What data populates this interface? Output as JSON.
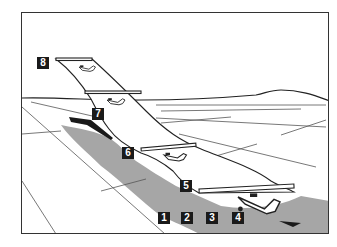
{
  "diagram": {
    "type": "takeoff-sequence-illustration",
    "colors": {
      "frame": "#333333",
      "shadow": "#a6a6a6",
      "line": "#222222",
      "runway_lines": "#555555",
      "marker_bg": "#1a1a1a",
      "marker_text": "#ffffff"
    },
    "markers": [
      {
        "id": 1,
        "label": "1"
      },
      {
        "id": 2,
        "label": "2"
      },
      {
        "id": 3,
        "label": "3"
      },
      {
        "id": 4,
        "label": "4"
      },
      {
        "id": 5,
        "label": "5"
      },
      {
        "id": 6,
        "label": "6"
      },
      {
        "id": 7,
        "label": "7"
      },
      {
        "id": 8,
        "label": "8"
      }
    ],
    "aircraft_positions": [
      {
        "name": "airplane-ground-roll",
        "marker": "4"
      },
      {
        "name": "airplane-lift-off",
        "marker": "5"
      },
      {
        "name": "airplane-initial-climb",
        "marker": "6"
      },
      {
        "name": "airplane-climb",
        "marker": "7"
      },
      {
        "name": "airplane-climb-out",
        "marker": "8"
      }
    ]
  }
}
